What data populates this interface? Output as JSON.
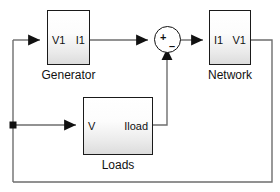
{
  "diagram": {
    "canvas": {
      "width": 280,
      "height": 192,
      "background": "#ffffff"
    },
    "line_color": "#6e6e6e",
    "outline_color": "#1a1a1a",
    "blocks": [
      {
        "id": "generator",
        "label": "Generator",
        "input_port": "V1",
        "output_port": "I1"
      },
      {
        "id": "network",
        "label": "Network",
        "input_port": "I1",
        "output_port": "V1"
      },
      {
        "id": "loads",
        "label": "Loads",
        "input_port": "V",
        "output_port": "Iload"
      }
    ],
    "sum_junction": {
      "id": "sum",
      "name": "summing-junction",
      "plus_sign": "+",
      "minus_sign": "–"
    }
  }
}
